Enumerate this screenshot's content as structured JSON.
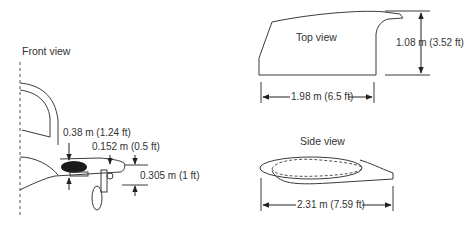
{
  "front_view": {
    "title": "Front view",
    "dims": {
      "pod_height": "0.38 m (1.24 ft)",
      "wall_thickness": "0.152 m (0.5 ft)",
      "ground_clearance": "0.305 m (1 ft)"
    }
  },
  "top_view": {
    "title": "Top view",
    "dims": {
      "width": "1.08 m (3.52 ft)",
      "length": "1.98 m (6.5 ft)"
    }
  },
  "side_view": {
    "title": "Side view",
    "dims": {
      "length": "2.31 m (7.59 ft)"
    }
  },
  "colors": {
    "line": "#3a3a3a",
    "fill_dark": "#1a1a1a"
  }
}
